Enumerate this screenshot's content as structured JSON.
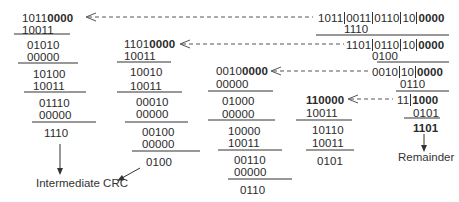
{
  "diagram": {
    "type": "crc-polynomial-division",
    "columns": [
      {
        "dividend_plain": "1011",
        "dividend_bold": "0000",
        "steps": [
          "10011",
          "01010",
          "00000",
          "10100",
          "10011",
          "01110",
          "00000"
        ],
        "result": "1110"
      },
      {
        "dividend_plain": "1101",
        "dividend_bold": "0000",
        "steps": [
          "10011",
          "10010",
          "10011",
          "00010",
          "00000",
          "00100",
          "00000"
        ],
        "result": "0100"
      },
      {
        "dividend_plain": "0010",
        "dividend_bold": "0000",
        "steps": [
          "00000",
          "01000",
          "00000",
          "10000",
          "10011",
          "00110",
          "00000"
        ],
        "result": "0110"
      },
      {
        "dividend_plain": "",
        "dividend_bold": "110000",
        "steps": [
          "10011",
          "10110",
          "10011"
        ],
        "result": "0101"
      }
    ],
    "message_rows": [
      {
        "parts": [
          "1011",
          "0011",
          "0110",
          "10"
        ],
        "bold": "0000",
        "xor": "1110"
      },
      {
        "parts": [
          "1101",
          "0110",
          "10"
        ],
        "bold": "0000",
        "xor": "0100"
      },
      {
        "parts": [
          "0010",
          "10"
        ],
        "bold": "0000",
        "xor": "0110"
      },
      {
        "parts": [
          "11"
        ],
        "bold": "1000",
        "xor": "0101"
      }
    ],
    "final_result": "1101",
    "labels": {
      "intermediate": "Intermediate CRC",
      "remainder": "Remainder"
    }
  }
}
